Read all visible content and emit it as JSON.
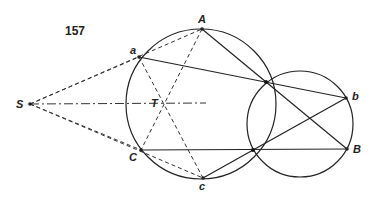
{
  "figure": {
    "number": "157",
    "points": {
      "S": {
        "label": "S",
        "x": 30,
        "y": 104
      },
      "T": {
        "label": "T",
        "x": 163,
        "y": 103
      },
      "A": {
        "label": "A",
        "x": 202,
        "y": 29
      },
      "a": {
        "label": "a",
        "x": 139,
        "y": 57
      },
      "C": {
        "label": "C",
        "x": 141,
        "y": 150
      },
      "c": {
        "label": "c",
        "x": 203,
        "y": 178
      },
      "b": {
        "label": "b",
        "x": 346,
        "y": 98
      },
      "B": {
        "label": "B",
        "x": 347,
        "y": 149
      },
      "P": {
        "x": 266,
        "y": 82
      },
      "Q": {
        "x": 253,
        "y": 150
      }
    },
    "circles": [
      {
        "name": "large-circle",
        "cx": 201,
        "cy": 104,
        "r": 75
      },
      {
        "name": "small-circle",
        "cx": 300,
        "cy": 124,
        "r": 53
      }
    ],
    "solid_lines": [
      [
        "a",
        "b"
      ],
      [
        "A",
        "B"
      ],
      [
        "C",
        "B"
      ],
      [
        "c",
        "b"
      ]
    ],
    "dashed_lines": [
      [
        "S",
        "A"
      ],
      [
        "S",
        "a"
      ],
      [
        "S",
        "C"
      ],
      [
        "S",
        "c"
      ],
      [
        "a",
        "c"
      ],
      [
        "A",
        "C"
      ]
    ],
    "dashdot_lines": [
      [
        "S",
        "T"
      ]
    ]
  }
}
